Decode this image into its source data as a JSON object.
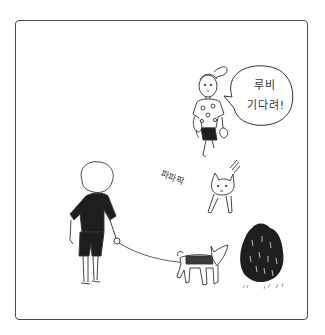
{
  "panel": {
    "border_color": "#4a4a4a",
    "background": "#ffffff"
  },
  "speech_bubble": {
    "line1": "루비",
    "line2": "기다려!"
  },
  "sound_effect": {
    "text": "파파팍"
  },
  "characters": [
    {
      "id": "woman",
      "description": "woman with ponytail in patterned top calling out"
    },
    {
      "id": "running-dog",
      "description": "small dog dashing toward the scene"
    },
    {
      "id": "man",
      "description": "man in black t-shirt holding a leash"
    },
    {
      "id": "leashed-dog",
      "description": "dog in harness on leash"
    }
  ],
  "scenery": [
    {
      "id": "bush",
      "description": "dark shrub with grass tufts"
    }
  ],
  "colors": {
    "ink": "#1e1e1e",
    "line": "#3a3a3a"
  }
}
